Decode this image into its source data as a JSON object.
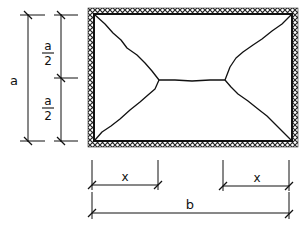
{
  "diagram": {
    "type": "slab yield-line pattern with dimensions",
    "colors": {
      "line": "#111111",
      "hatch": "#222222",
      "background": "#ffffff"
    },
    "labels": {
      "height": "a",
      "half_top_num": "a",
      "half_top_den": "2",
      "half_bottom_num": "a",
      "half_bottom_den": "2",
      "x_left": "x",
      "x_right": "x",
      "width": "b"
    },
    "slab": {
      "support": "fixed edges (hatched on all four sides)",
      "junction_left": [
        159,
        80
      ],
      "junction_right": [
        225,
        80
      ]
    },
    "dimensions": [
      {
        "name": "a",
        "orientation": "vertical",
        "label": "a"
      },
      {
        "name": "a/2 top",
        "orientation": "vertical",
        "label": "a/2"
      },
      {
        "name": "a/2 bottom",
        "orientation": "vertical",
        "label": "a/2"
      },
      {
        "name": "x left",
        "orientation": "horizontal",
        "label": "x"
      },
      {
        "name": "x right",
        "orientation": "horizontal",
        "label": "x"
      },
      {
        "name": "b",
        "orientation": "horizontal",
        "label": "b"
      }
    ]
  }
}
